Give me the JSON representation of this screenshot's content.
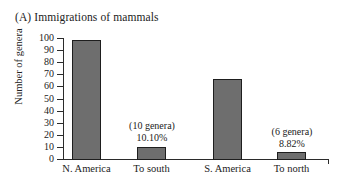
{
  "chart_data": {
    "type": "bar",
    "title": "(A) Immigrations of mammals",
    "xlabel": "",
    "ylabel": "Number of genera",
    "ylim": [
      0,
      100
    ],
    "yticks": [
      0,
      10,
      20,
      30,
      40,
      50,
      60,
      70,
      80,
      90,
      100
    ],
    "ytick_labels": [
      "0",
      "10",
      "20",
      "30",
      "40",
      "50",
      "60",
      "70",
      "80",
      "90",
      "100"
    ],
    "categories": [
      "N. America",
      "To south",
      "S. America",
      "To north"
    ],
    "values": [
      99,
      10,
      66,
      6
    ],
    "grid": false,
    "legend": false,
    "bar_color": "#6e6e6e",
    "bar_edge_color": "#1e1e1e",
    "annotations": [
      {
        "for_category": "To south",
        "genera_text": "(10 genera)",
        "percent_text": "10.10%"
      },
      {
        "for_category": "To north",
        "genera_text": "(6 genera)",
        "percent_text": "8.82%"
      }
    ]
  },
  "bars": [
    {
      "label": "N. America",
      "value": 99,
      "left": 72,
      "width": 29,
      "top": 40,
      "height": 120,
      "label_left": 55,
      "label_width": 63
    },
    {
      "label": "To south",
      "value": 10,
      "left": 137,
      "width": 29,
      "top": 147,
      "height": 13,
      "label_left": 121,
      "label_width": 61
    },
    {
      "label": "S. America",
      "value": 66,
      "left": 213,
      "width": 29,
      "top": 79,
      "height": 81,
      "label_left": 196,
      "label_width": 63
    },
    {
      "label": "To north",
      "value": 6,
      "left": 277,
      "width": 29,
      "top": 152,
      "height": 8,
      "label_left": 261,
      "label_width": 61
    }
  ],
  "annotation_blocks": [
    {
      "genera": "(10 genera)",
      "percent": "10.10%",
      "left": 111,
      "top": 120,
      "width": 82
    },
    {
      "genera": "(6 genera)",
      "percent": "8.82%",
      "left": 253,
      "top": 126,
      "width": 78
    }
  ],
  "yticks": [
    {
      "label": "100",
      "top": 38
    },
    {
      "label": "90",
      "top": 50
    },
    {
      "label": "80",
      "top": 62
    },
    {
      "label": "70",
      "top": 74
    },
    {
      "label": "60",
      "top": 86
    },
    {
      "label": "50",
      "top": 99
    },
    {
      "label": "40",
      "top": 111
    },
    {
      "label": "30",
      "top": 123
    },
    {
      "label": "20",
      "top": 135
    },
    {
      "label": "10",
      "top": 147
    },
    {
      "label": "0",
      "top": 159
    }
  ]
}
